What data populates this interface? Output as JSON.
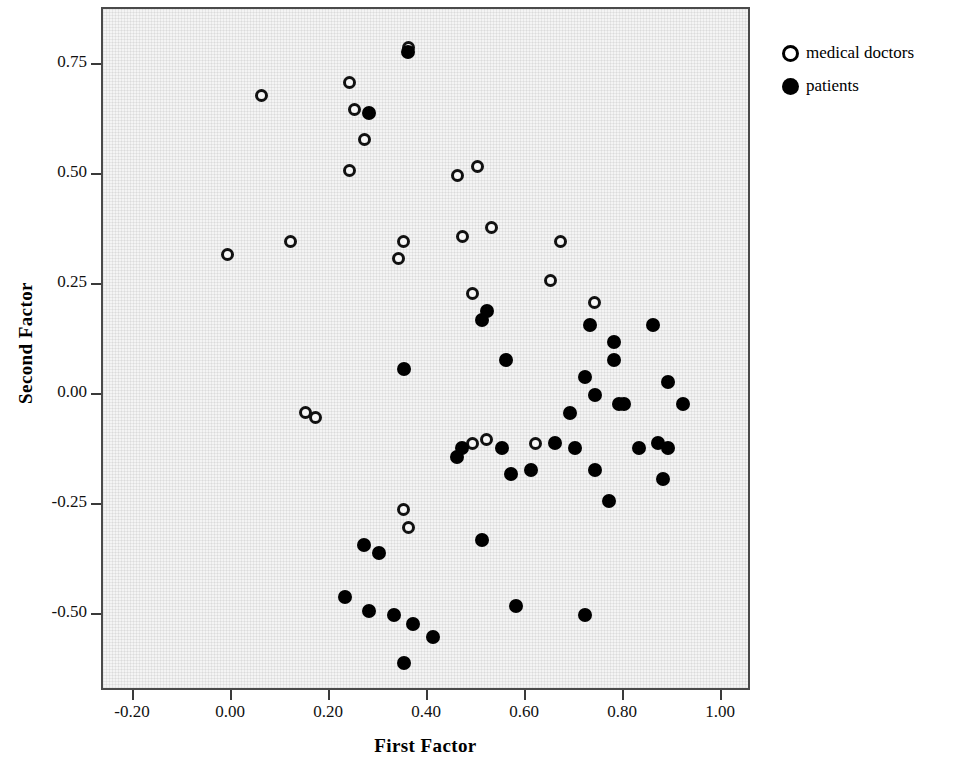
{
  "chart_data": {
    "type": "scatter",
    "title": "",
    "xlabel": "First Factor",
    "ylabel": "Second Factor",
    "xlim": [
      -0.3,
      1.07
    ],
    "ylim": [
      -0.68,
      0.86
    ],
    "xticks": [
      -0.2,
      0.0,
      0.2,
      0.4,
      0.6,
      0.8,
      1.0
    ],
    "xticklabels": [
      "-0.20",
      "0.00",
      "0.20",
      "0.40",
      "0.60",
      "0.80",
      "1.00"
    ],
    "yticks": [
      0.75,
      0.5,
      0.25,
      0.0,
      -0.25,
      -0.5
    ],
    "yticklabels": [
      "0.75",
      "0.50",
      "0.25",
      "0.00",
      "-0.25",
      "-0.50"
    ],
    "grid": false,
    "legend_position": "right-top",
    "marker_colors": {
      "medical_doctors": "#ffffff",
      "patients": "#000000",
      "edge": "#000000"
    },
    "plot_background": "#f4f4f4",
    "series": [
      {
        "name": "medical doctors",
        "marker": "open-circle",
        "points": [
          [
            0.06,
            0.68
          ],
          [
            -0.01,
            0.32
          ],
          [
            0.12,
            0.35
          ],
          [
            0.24,
            0.71
          ],
          [
            0.25,
            0.65
          ],
          [
            0.27,
            0.58
          ],
          [
            0.24,
            0.51
          ],
          [
            0.36,
            0.79
          ],
          [
            0.35,
            0.35
          ],
          [
            0.34,
            0.31
          ],
          [
            0.46,
            0.5
          ],
          [
            0.5,
            0.52
          ],
          [
            0.47,
            0.36
          ],
          [
            0.53,
            0.38
          ],
          [
            0.49,
            0.23
          ],
          [
            0.67,
            0.35
          ],
          [
            0.65,
            0.26
          ],
          [
            0.74,
            0.21
          ],
          [
            0.15,
            -0.04
          ],
          [
            0.17,
            -0.05
          ],
          [
            0.49,
            -0.11
          ],
          [
            0.52,
            -0.1
          ],
          [
            0.62,
            -0.11
          ],
          [
            0.35,
            -0.26
          ],
          [
            0.36,
            -0.3
          ]
        ]
      },
      {
        "name": "patients",
        "marker": "filled-circle",
        "points": [
          [
            0.28,
            0.64
          ],
          [
            0.36,
            0.78
          ],
          [
            0.52,
            0.19
          ],
          [
            0.51,
            0.17
          ],
          [
            0.73,
            0.16
          ],
          [
            0.86,
            0.16
          ],
          [
            0.78,
            0.12
          ],
          [
            0.78,
            0.08
          ],
          [
            0.56,
            0.08
          ],
          [
            0.35,
            0.06
          ],
          [
            0.72,
            0.04
          ],
          [
            0.89,
            0.03
          ],
          [
            0.74,
            0.0
          ],
          [
            0.79,
            -0.02
          ],
          [
            0.8,
            -0.02
          ],
          [
            0.92,
            -0.02
          ],
          [
            0.69,
            -0.04
          ],
          [
            0.47,
            -0.12
          ],
          [
            0.46,
            -0.14
          ],
          [
            0.55,
            -0.12
          ],
          [
            0.66,
            -0.11
          ],
          [
            0.7,
            -0.12
          ],
          [
            0.83,
            -0.12
          ],
          [
            0.87,
            -0.11
          ],
          [
            0.89,
            -0.12
          ],
          [
            0.57,
            -0.18
          ],
          [
            0.61,
            -0.17
          ],
          [
            0.74,
            -0.17
          ],
          [
            0.88,
            -0.19
          ],
          [
            0.77,
            -0.24
          ],
          [
            0.51,
            -0.33
          ],
          [
            0.27,
            -0.34
          ],
          [
            0.3,
            -0.36
          ],
          [
            0.23,
            -0.46
          ],
          [
            0.58,
            -0.48
          ],
          [
            0.28,
            -0.49
          ],
          [
            0.33,
            -0.5
          ],
          [
            0.72,
            -0.5
          ],
          [
            0.37,
            -0.52
          ],
          [
            0.41,
            -0.55
          ],
          [
            0.35,
            -0.61
          ]
        ]
      }
    ]
  },
  "legend": {
    "entries": [
      {
        "label": "medical doctors",
        "marker": "open-circle"
      },
      {
        "label": "patients",
        "marker": "filled-circle"
      }
    ]
  }
}
